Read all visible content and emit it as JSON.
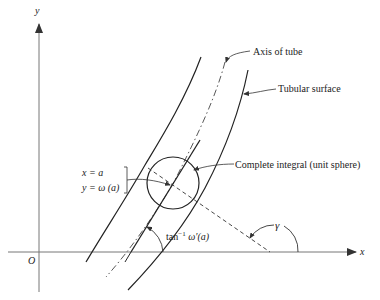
{
  "diagram": {
    "axes": {
      "x_label": "x",
      "y_label": "y",
      "origin_label": "O"
    },
    "labels": {
      "axis_of_tube": "Axis of tube",
      "tubular_surface": "Tubular surface",
      "complete_integral": "Complete integral (unit sphere)",
      "point_x": "x = a",
      "point_y": "y = ω (a)",
      "tan_angle_base": "tan",
      "tan_angle_sup": "−1",
      "tan_angle_arg": " ω′(a)",
      "gamma": "γ"
    },
    "colors": {
      "ink": "#222222",
      "axis_gray": "#777777",
      "background": "#ffffff"
    }
  }
}
